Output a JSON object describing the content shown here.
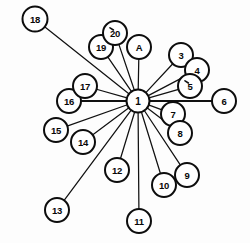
{
  "diagram": {
    "type": "node-link-graph",
    "background_color": "#fdfdfd",
    "node_fill_color": "#ffffff",
    "node_stroke_color": "#0d0d0d",
    "edge_color": "#111111",
    "hub_node_id": "1",
    "node_count": 21,
    "edge_count": 20,
    "nodes": [
      {
        "id": "1",
        "label": "1",
        "cx": 138,
        "cy": 101,
        "r": 11.5,
        "role": "hub",
        "tick": false
      },
      {
        "id": "3",
        "label": "3",
        "cx": 181,
        "cy": 55,
        "r": 12.0,
        "role": "leaf",
        "tick": false
      },
      {
        "id": "4",
        "label": "4",
        "cx": 197,
        "cy": 70,
        "r": 12.0,
        "role": "leaf",
        "tick": false
      },
      {
        "id": "5",
        "label": "5",
        "cx": 190,
        "cy": 86,
        "r": 12.0,
        "role": "leaf",
        "tick": true
      },
      {
        "id": "6",
        "label": "6",
        "cx": 224,
        "cy": 101,
        "r": 12.0,
        "role": "leaf",
        "tick": false
      },
      {
        "id": "7",
        "label": "7",
        "cx": 173,
        "cy": 114,
        "r": 12.0,
        "role": "leaf",
        "tick": false
      },
      {
        "id": "8",
        "label": "8",
        "cx": 180,
        "cy": 133,
        "r": 12.0,
        "role": "leaf",
        "tick": false
      },
      {
        "id": "9",
        "label": "9",
        "cx": 187,
        "cy": 175,
        "r": 12.0,
        "role": "leaf",
        "tick": false
      },
      {
        "id": "10",
        "label": "10",
        "cx": 164,
        "cy": 185,
        "r": 12.0,
        "role": "leaf",
        "tick": false
      },
      {
        "id": "11",
        "label": "11",
        "cx": 139,
        "cy": 221,
        "r": 12.0,
        "role": "leaf",
        "tick": false
      },
      {
        "id": "12",
        "label": "12",
        "cx": 117,
        "cy": 170,
        "r": 12.0,
        "role": "leaf",
        "tick": false
      },
      {
        "id": "13",
        "label": "13",
        "cx": 57,
        "cy": 210,
        "r": 12.0,
        "role": "leaf",
        "tick": false
      },
      {
        "id": "14",
        "label": "14",
        "cx": 83,
        "cy": 142,
        "r": 12.0,
        "role": "leaf",
        "tick": false
      },
      {
        "id": "15",
        "label": "15",
        "cx": 56,
        "cy": 130,
        "r": 12.0,
        "role": "leaf",
        "tick": false
      },
      {
        "id": "16",
        "label": "16",
        "cx": 69,
        "cy": 101,
        "r": 12.0,
        "role": "leaf",
        "tick": false
      },
      {
        "id": "17",
        "label": "17",
        "cx": 85,
        "cy": 86,
        "r": 12.0,
        "role": "leaf",
        "tick": false
      },
      {
        "id": "18",
        "label": "18",
        "cx": 35,
        "cy": 19,
        "r": 12.5,
        "role": "leaf",
        "tick": false
      },
      {
        "id": "19",
        "label": "19",
        "cx": 101,
        "cy": 47,
        "r": 12.0,
        "role": "leaf",
        "tick": false
      },
      {
        "id": "20",
        "label": "20",
        "cx": 115,
        "cy": 33,
        "r": 12.0,
        "role": "leaf",
        "tick": true
      },
      {
        "id": "A",
        "label": "A",
        "cx": 139,
        "cy": 47,
        "r": 12.0,
        "role": "leaf",
        "tick": false
      }
    ],
    "edges": [
      {
        "from": "1",
        "to": "3",
        "weight": "normal"
      },
      {
        "from": "1",
        "to": "4",
        "weight": "normal"
      },
      {
        "from": "1",
        "to": "5",
        "weight": "normal"
      },
      {
        "from": "1",
        "to": "6",
        "weight": "thick"
      },
      {
        "from": "1",
        "to": "7",
        "weight": "normal"
      },
      {
        "from": "1",
        "to": "8",
        "weight": "normal"
      },
      {
        "from": "1",
        "to": "9",
        "weight": "normal"
      },
      {
        "from": "1",
        "to": "10",
        "weight": "normal"
      },
      {
        "from": "1",
        "to": "11",
        "weight": "normal"
      },
      {
        "from": "1",
        "to": "12",
        "weight": "normal"
      },
      {
        "from": "1",
        "to": "13",
        "weight": "normal"
      },
      {
        "from": "1",
        "to": "14",
        "weight": "normal"
      },
      {
        "from": "1",
        "to": "15",
        "weight": "normal"
      },
      {
        "from": "1",
        "to": "16",
        "weight": "thick"
      },
      {
        "from": "1",
        "to": "17",
        "weight": "normal"
      },
      {
        "from": "1",
        "to": "18",
        "weight": "normal"
      },
      {
        "from": "1",
        "to": "19",
        "weight": "normal"
      },
      {
        "from": "1",
        "to": "20",
        "weight": "normal"
      },
      {
        "from": "1",
        "to": "A",
        "weight": "normal"
      }
    ],
    "render_order": [
      "3",
      "4",
      "5",
      "6",
      "7",
      "8",
      "9",
      "10",
      "11",
      "12",
      "13",
      "14",
      "15",
      "16",
      "17",
      "18",
      "19",
      "20",
      "A",
      "1"
    ]
  }
}
